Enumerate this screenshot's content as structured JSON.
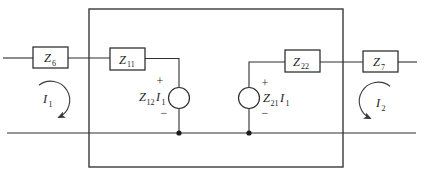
{
  "figure": {
    "type": "circuit-diagram",
    "line_color": "#2f2f2f",
    "background": "#ffffff"
  },
  "components": {
    "z6": {
      "base": "Z",
      "sub": "6"
    },
    "z11": {
      "base": "Z",
      "sub": "11"
    },
    "z22": {
      "base": "Z",
      "sub": "22"
    },
    "z7": {
      "base": "Z",
      "sub": "7"
    },
    "source1": {
      "base": "Z",
      "sub": "12",
      "base2": "I",
      "sub2": "1",
      "plus": "+",
      "minus": "−"
    },
    "source2": {
      "base": "Z",
      "sub": "21",
      "base2": "I",
      "sub2": "1",
      "plus": "+",
      "minus": "−"
    },
    "mesh1": {
      "base": "I",
      "sub": "1"
    },
    "mesh2": {
      "base": "I",
      "sub": "2"
    }
  }
}
